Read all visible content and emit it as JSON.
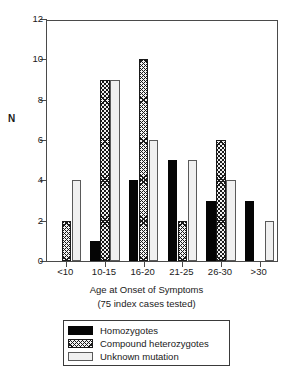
{
  "chart_data": {
    "type": "bar",
    "title": "",
    "xlabel": "Age at Onset of Symptoms",
    "xlabel_sub": "(75 index cases tested)",
    "ylabel": "N",
    "ylim": [
      0,
      12
    ],
    "yticks": [
      0,
      2,
      4,
      6,
      8,
      10,
      12
    ],
    "grid": false,
    "legend_position": "below-plot",
    "categories": [
      "<10",
      "10-15",
      "16-20",
      "21-25",
      "26-30",
      ">30"
    ],
    "series": [
      {
        "name": "Homozygotes",
        "fill": "solid-black",
        "values": [
          0,
          1,
          4,
          5,
          3,
          3
        ]
      },
      {
        "name": "Compound heterozygotes",
        "fill": "cross-hatch",
        "values": [
          2,
          9,
          10,
          2,
          6,
          0
        ]
      },
      {
        "name": "Unknown mutation",
        "fill": "open-white",
        "values": [
          4,
          9,
          6,
          5,
          4,
          2
        ]
      }
    ]
  },
  "legend": {
    "items": [
      {
        "label": "Homozygotes",
        "swatch": "solid"
      },
      {
        "label": "Compound heterozygotes",
        "swatch": "hatch"
      },
      {
        "label": "Unknown mutation",
        "swatch": "open"
      }
    ]
  },
  "colors": {
    "homozygotes": "#050505",
    "compound_heterozygotes": "#1a1a1a",
    "unknown_mutation": "#f0f0f0",
    "axis": "#4a4a4a",
    "text": "#1a1a1a",
    "background": "#ffffff"
  }
}
